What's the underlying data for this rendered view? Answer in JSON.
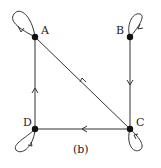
{
  "diagram": {
    "caption": "(b)",
    "nodes": [
      {
        "id": "A",
        "label": "A",
        "x": 35,
        "y": 37
      },
      {
        "id": "B",
        "label": "B",
        "x": 130,
        "y": 37
      },
      {
        "id": "C",
        "label": "C",
        "x": 130,
        "y": 129
      },
      {
        "id": "D",
        "label": "D",
        "x": 35,
        "y": 129
      }
    ],
    "edges": [
      {
        "from": "A",
        "to": "A",
        "type": "self-loop"
      },
      {
        "from": "B",
        "to": "B",
        "type": "self-loop"
      },
      {
        "from": "C",
        "to": "C",
        "type": "self-loop"
      },
      {
        "from": "D",
        "to": "D",
        "type": "self-loop"
      },
      {
        "from": "B",
        "to": "C",
        "type": "directed"
      },
      {
        "from": "C",
        "to": "A",
        "type": "directed"
      },
      {
        "from": "C",
        "to": "D",
        "type": "directed"
      },
      {
        "from": "D",
        "to": "A",
        "type": "directed"
      }
    ],
    "colors": {
      "stroke": "#333333",
      "node": "#111111"
    }
  }
}
